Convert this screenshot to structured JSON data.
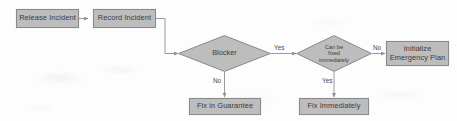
{
  "diagram": {
    "colors": {
      "node_fill": "#bdbdbd",
      "node_border": "#8a8a8a",
      "text": "#3b3b3b",
      "connector": "#8f8f8f",
      "background": "#fdfdfd"
    },
    "nodes": {
      "release_incident": {
        "label": "Release Incident",
        "shape": "rectangle"
      },
      "record_incident": {
        "label": "Record Incident",
        "shape": "rectangle"
      },
      "blocker": {
        "label": "Blocker",
        "shape": "diamond"
      },
      "can_be_fixed": {
        "label": "Can be\nfixed\nimmediately",
        "shape": "diamond"
      },
      "initialize_emergency_plan": {
        "label": "Initialize\nEmergency Plan",
        "shape": "rectangle"
      },
      "fix_in_guarantee": {
        "label": "Fix in Guarantee",
        "shape": "rectangle"
      },
      "fix_immediately": {
        "label": "Fix Immediately",
        "shape": "rectangle"
      }
    },
    "edge_labels": {
      "blocker_yes": "Yes",
      "blocker_no": "No",
      "can_be_fixed_no": "No",
      "can_be_fixed_yes": "Yes"
    }
  }
}
